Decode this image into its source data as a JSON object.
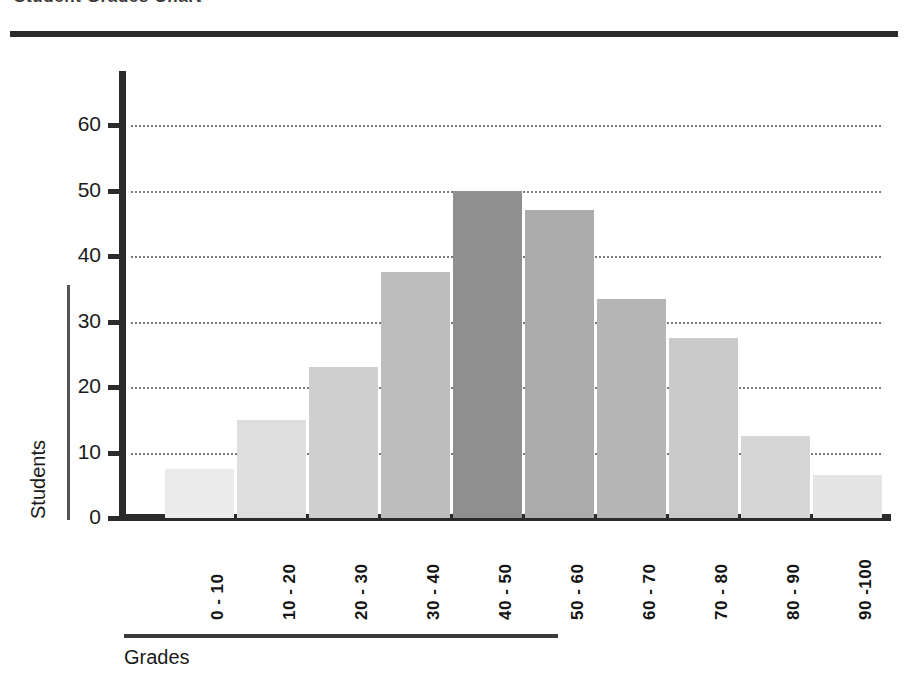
{
  "chart_data": {
    "type": "bar",
    "title": "Student Grades Chart",
    "xlabel": "Grades",
    "ylabel": "Students",
    "categories": [
      "0 - 10",
      "10 - 20",
      "20 - 30",
      "30 - 40",
      "40 - 50",
      "50 - 60",
      "60 - 70",
      "70 - 80",
      "80 - 90",
      "90 -100"
    ],
    "values": [
      7.5,
      15,
      23,
      37.5,
      50,
      47,
      33.5,
      27.5,
      12.5,
      6.5
    ],
    "bar_colors": [
      "#ebebeb",
      "#dedede",
      "#cfcfcf",
      "#bdbdbd",
      "#8f8f8f",
      "#ababab",
      "#b5b5b5",
      "#c9c9c9",
      "#d6d6d6",
      "#e4e4e4"
    ],
    "ylim": [
      0,
      65
    ],
    "ytick_values": [
      0,
      10,
      20,
      30,
      40,
      50,
      60
    ],
    "ytick_labels": [
      "0",
      "10",
      "20",
      "30",
      "40",
      "50",
      "60"
    ],
    "grid": true,
    "grid_style": "dotted",
    "grid_color": "#7a7a7a",
    "legend": "none",
    "axis_color": "#2b2b2b",
    "background": "#ffffff"
  }
}
